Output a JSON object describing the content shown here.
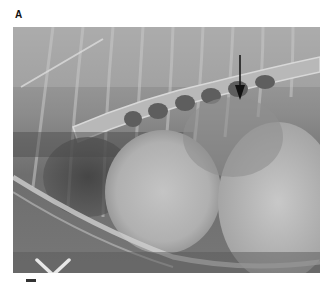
{
  "figure": {
    "panel_label": "A",
    "image_type": "lateral thoracic radiograph",
    "annotations": [
      {
        "type": "arrow",
        "direction": "down",
        "color": "#111111"
      }
    ],
    "colors": {
      "background": "#ffffff",
      "label": "#111111"
    }
  }
}
